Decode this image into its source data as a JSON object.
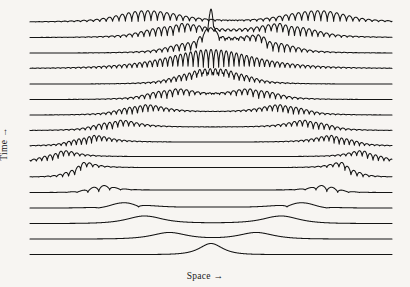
{
  "figure": {
    "background_color": "#f7f5f2",
    "line_color": "#141414"
  },
  "axes": {
    "xlabel": "Space →",
    "ylabel": "Time →"
  },
  "chart_data": {
    "type": "line",
    "title": "",
    "subtitle": "",
    "xlabel": "Space →",
    "ylabel": "Time →",
    "grid": false,
    "legend": null,
    "plot_area": {
      "x0": 30,
      "x1": 392,
      "y_top": 22,
      "y_bottom": 255
    },
    "n_traces": 16,
    "row_spacing": 15.5,
    "x_domain": [
      0,
      1
    ],
    "traces": [
      {
        "row": 15,
        "baseline_y": 22,
        "time_order": "latest",
        "packets": [
          {
            "center": 0.29,
            "width": 0.115,
            "amp": 17.5,
            "cycles": 6.5,
            "edge": "right",
            "chirp": 1.0
          },
          {
            "center": 0.83,
            "width": 0.115,
            "amp": 17.5,
            "cycles": 6.5,
            "edge": "left",
            "chirp": 1.0
          }
        ],
        "step": {
          "from": 0.345,
          "to": 0.775,
          "height": 0.0
        }
      },
      {
        "row": 14,
        "baseline_y": 37.5,
        "packets": [
          {
            "center": 0.355,
            "width": 0.105,
            "amp": 16.5,
            "cycles": 6.5,
            "edge": "right",
            "chirp": 1.0
          },
          {
            "center": 0.755,
            "width": 0.105,
            "amp": 16.5,
            "cycles": 6.5,
            "edge": "left",
            "chirp": 1.0
          }
        ],
        "step": {
          "from": 0.405,
          "to": 0.705,
          "height": 4.5
        }
      },
      {
        "row": 13,
        "baseline_y": 53,
        "packets": [
          {
            "center": 0.42,
            "width": 0.095,
            "amp": 15.5,
            "cycles": 6.0,
            "edge": "right",
            "chirp": 1.0
          },
          {
            "center": 0.695,
            "width": 0.095,
            "amp": 15.5,
            "cycles": 6.0,
            "edge": "left",
            "chirp": 1.0
          }
        ],
        "step": {
          "from": 0.465,
          "to": 0.65,
          "height": 9.0
        },
        "spike": {
          "center": 0.5,
          "amp": 26,
          "width": 0.006
        }
      },
      {
        "row": 12,
        "baseline_y": 68.5,
        "packets": [
          {
            "center": 0.5,
            "width": 0.155,
            "amp": 19.0,
            "cycles": 11.0,
            "edge": "none",
            "chirp": 0.0
          }
        ],
        "step": {
          "from": 0.4,
          "to": 0.6,
          "height": 0.0
        }
      },
      {
        "row": 11,
        "baseline_y": 84,
        "packets": [
          {
            "center": 0.425,
            "width": 0.085,
            "amp": 14.0,
            "cycles": 6.0,
            "edge": "right",
            "chirp": 1.0
          },
          {
            "center": 0.585,
            "width": 0.085,
            "amp": 14.0,
            "cycles": 6.0,
            "edge": "left",
            "chirp": 1.0
          }
        ],
        "step": {
          "from": 0.455,
          "to": 0.555,
          "height": 3.0
        }
      },
      {
        "row": 10,
        "baseline_y": 99.5,
        "packets": [
          {
            "center": 0.355,
            "width": 0.085,
            "amp": 13.5,
            "cycles": 5.5,
            "edge": "right",
            "chirp": 1.0
          },
          {
            "center": 0.655,
            "width": 0.085,
            "amp": 13.5,
            "cycles": 5.5,
            "edge": "left",
            "chirp": 1.0
          }
        ],
        "step": {
          "from": 0.395,
          "to": 0.615,
          "height": 3.0
        }
      },
      {
        "row": 9,
        "baseline_y": 115,
        "packets": [
          {
            "center": 0.275,
            "width": 0.08,
            "amp": 13.0,
            "cycles": 5.5,
            "edge": "right",
            "chirp": 1.0
          },
          {
            "center": 0.735,
            "width": 0.08,
            "amp": 13.0,
            "cycles": 5.5,
            "edge": "left",
            "chirp": 1.0
          }
        ],
        "step": {
          "from": 0.31,
          "to": 0.7,
          "height": 3.0
        }
      },
      {
        "row": 8,
        "baseline_y": 130.5,
        "packets": [
          {
            "center": 0.205,
            "width": 0.075,
            "amp": 12.5,
            "cycles": 5.0,
            "edge": "right",
            "chirp": 1.0
          },
          {
            "center": 0.805,
            "width": 0.075,
            "amp": 12.5,
            "cycles": 5.0,
            "edge": "left",
            "chirp": 1.0
          }
        ],
        "step": {
          "from": 0.24,
          "to": 0.77,
          "height": 3.5
        }
      },
      {
        "row": 7,
        "baseline_y": 146,
        "packets": [
          {
            "center": 0.135,
            "width": 0.07,
            "amp": 12.0,
            "cycles": 5.0,
            "edge": "right",
            "chirp": 1.0
          },
          {
            "center": 0.875,
            "width": 0.07,
            "amp": 12.0,
            "cycles": 5.0,
            "edge": "left",
            "chirp": 1.0
          }
        ],
        "step": {
          "from": 0.165,
          "to": 0.845,
          "height": 4.0
        }
      },
      {
        "row": 6,
        "baseline_y": 161.5,
        "packets": [
          {
            "center": 0.055,
            "width": 0.06,
            "amp": 11.0,
            "cycles": 4.0,
            "edge": "right",
            "chirp": 1.0
          },
          {
            "center": 0.955,
            "width": 0.06,
            "amp": 11.0,
            "cycles": 4.0,
            "edge": "left",
            "chirp": 1.0
          }
        ],
        "step": {
          "from": 0.08,
          "to": 0.93,
          "height": 5.0
        }
      },
      {
        "row": 5,
        "baseline_y": 177,
        "packets": [
          {
            "center": 0.115,
            "width": 0.05,
            "amp": 10.5,
            "cycles": 3.0,
            "edge": "right",
            "chirp": 1.0
          },
          {
            "center": 0.895,
            "width": 0.05,
            "amp": 10.5,
            "cycles": 3.0,
            "edge": "left",
            "chirp": 1.0
          }
        ],
        "step": {
          "from": 0.135,
          "to": 0.875,
          "height": 9.5
        }
      },
      {
        "row": 4,
        "baseline_y": 192.5,
        "packets": [
          {
            "center": 0.175,
            "width": 0.045,
            "amp": 8.5,
            "cycles": 1.5,
            "edge": "right",
            "chirp": 1.0
          },
          {
            "center": 0.835,
            "width": 0.045,
            "amp": 8.5,
            "cycles": 1.5,
            "edge": "left",
            "chirp": 1.0
          }
        ],
        "step": {
          "from": 0.195,
          "to": 0.815,
          "height": 2.5
        }
      },
      {
        "row": 3,
        "baseline_y": 208,
        "packets": [
          {
            "center": 0.245,
            "width": 0.055,
            "amp": 8.0,
            "cycles": 0.5,
            "edge": "right",
            "chirp": 1.0
          },
          {
            "center": 0.765,
            "width": 0.055,
            "amp": 8.0,
            "cycles": 0.5,
            "edge": "left",
            "chirp": 1.0
          }
        ],
        "step": {
          "from": 0.265,
          "to": 0.745,
          "height": 1.0
        }
      },
      {
        "row": 2,
        "baseline_y": 223.5,
        "packets": [
          {
            "center": 0.315,
            "width": 0.06,
            "amp": 7.5,
            "cycles": 0.0,
            "edge": "right",
            "chirp": 1.0
          },
          {
            "center": 0.695,
            "width": 0.06,
            "amp": 7.5,
            "cycles": 0.0,
            "edge": "left",
            "chirp": 1.0
          }
        ],
        "step": {
          "from": 0.335,
          "to": 0.675,
          "height": 0.5
        }
      },
      {
        "row": 1,
        "baseline_y": 239,
        "packets": [
          {
            "center": 0.385,
            "width": 0.06,
            "amp": 6.5,
            "cycles": 0.0,
            "edge": "none",
            "chirp": 0.0
          },
          {
            "center": 0.625,
            "width": 0.06,
            "amp": 6.5,
            "cycles": 0.0,
            "edge": "none",
            "chirp": 0.0
          }
        ],
        "step": null
      },
      {
        "row": 0,
        "baseline_y": 254.5,
        "time_order": "earliest",
        "packets": [
          {
            "center": 0.5,
            "width": 0.04,
            "amp": 11.0,
            "cycles": 0.0,
            "edge": "none",
            "chirp": 0.0
          }
        ],
        "step": null
      }
    ]
  }
}
